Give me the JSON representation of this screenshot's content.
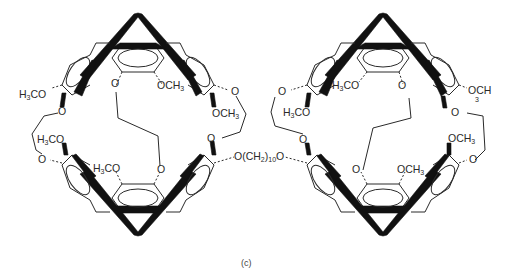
{
  "figure": {
    "caption": "(c)",
    "linker": {
      "text": "O(CH",
      "sub": "2",
      "tail": ")",
      "sub2": "10",
      "end": "O"
    },
    "left_cage": {
      "labels": [
        {
          "id": "l-h3co-left",
          "pre": "H",
          "sub": "3",
          "post": "CO"
        },
        {
          "id": "l-o-top",
          "pre": "O"
        },
        {
          "id": "l-och3-top",
          "pre": "OCH",
          "sub": "3"
        },
        {
          "id": "l-o-tr",
          "pre": "O"
        },
        {
          "id": "l-och3-r",
          "pre": "OCH",
          "sub": "3"
        },
        {
          "id": "l-o-left",
          "pre": "O"
        },
        {
          "id": "l-h3co-ml",
          "pre": "H",
          "sub": "3",
          "post": "CO"
        },
        {
          "id": "l-o-ml",
          "pre": "O"
        },
        {
          "id": "l-h3co-bot",
          "pre": "H",
          "sub": "3",
          "post": "CO"
        },
        {
          "id": "l-o-bot",
          "pre": "O"
        },
        {
          "id": "l-o-br",
          "pre": "O"
        }
      ]
    },
    "right_cage": {
      "labels": [
        {
          "id": "r-o-tl",
          "pre": "O"
        },
        {
          "id": "r-h3co-top",
          "pre": "H",
          "sub": "3",
          "post": "CO"
        },
        {
          "id": "r-o-top",
          "pre": "O"
        },
        {
          "id": "r-h3co-l",
          "pre": "H",
          "sub": "3",
          "post": "CO"
        },
        {
          "id": "r-och3-tr",
          "pre": "OCH",
          "sub3": "3"
        },
        {
          "id": "r-o-r",
          "pre": "O"
        },
        {
          "id": "r-o-ml",
          "pre": "O"
        },
        {
          "id": "r-och3-mr",
          "pre": "OCH",
          "sub": "3"
        },
        {
          "id": "r-o-mr",
          "pre": "O"
        },
        {
          "id": "r-o-bot",
          "pre": "O"
        },
        {
          "id": "r-och3-bot",
          "pre": "OCH",
          "sub": "3"
        }
      ]
    }
  }
}
